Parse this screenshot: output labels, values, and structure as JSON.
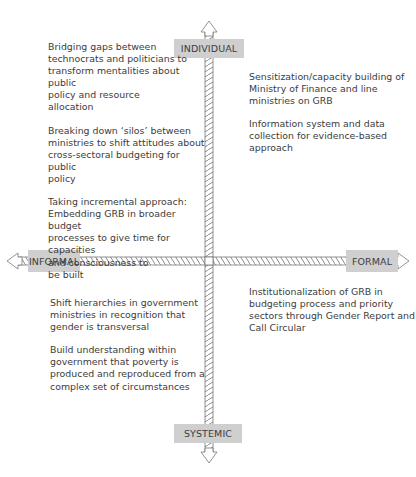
{
  "axes": {
    "top_label": "INDIVIDUAL",
    "bottom_label": "SYSTEMIC",
    "left_label": "INFORMAL",
    "right_label": "FORMAL",
    "colors": {
      "label_bg": "#cfcfcf",
      "axis_stroke": "#777777",
      "text": "#3c3c3c"
    }
  },
  "quadrants": {
    "top_left": [
      "Bridging gaps between\ntechnocrats and politicians to\ntransform mentalities about public\npolicy and resource\nallocation",
      "Breaking down ‘silos’ between\nministries to shift attitudes about\ncross-sectoral budgeting for public\npolicy",
      "Taking incremental approach:\nEmbedding GRB in broader budget\nprocesses to give time for capacities\nand consciousness to\nbe built"
    ],
    "top_right": [
      "Sensitization/capacity building of\nMinistry of Finance and line\nministries on GRB",
      "Information system and data\ncollection for evidence-based\napproach"
    ],
    "bottom_left": [
      "Shift hierarchies in government\nministries in recognition that\ngender is transversal",
      "Build understanding within\ngovernment that poverty is\nproduced and reproduced from a\ncomplex set of circumstances"
    ],
    "bottom_right": [
      "Institutionalization of GRB in\nbudgeting process and priority\nsectors through Gender Report and\nCall Circular"
    ]
  }
}
